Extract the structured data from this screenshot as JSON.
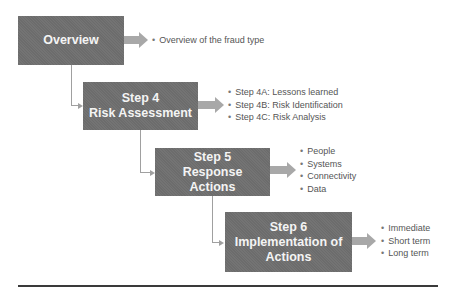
{
  "diagram": {
    "colors": {
      "box": "#6f6f6f",
      "box_text": "#f4f4f4",
      "arrow": "#a8a8a8",
      "connector": "#a0a0a0",
      "bullet_text": "#555555",
      "rule": "#3a3a3a"
    },
    "steps": [
      {
        "title_lines": [
          "Overview"
        ],
        "bullets": [
          "Overview of the fraud type"
        ]
      },
      {
        "title_lines": [
          "Step 4",
          "Risk Assessment"
        ],
        "bullets": [
          "Step 4A: Lessons learned",
          "Step 4B: Risk Identification",
          "Step 4C: Risk Analysis"
        ]
      },
      {
        "title_lines": [
          "Step 5",
          "Response Actions"
        ],
        "bullets": [
          "People",
          "Systems",
          "Connectivity",
          "Data"
        ]
      },
      {
        "title_lines": [
          "Step 6",
          "Implementation of",
          "Actions"
        ],
        "bullets": [
          "Immediate",
          "Short term",
          "Long term"
        ]
      }
    ]
  }
}
